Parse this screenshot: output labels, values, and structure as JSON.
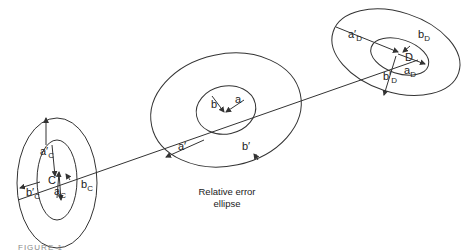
{
  "diagram": {
    "caption_line1": "Relative error",
    "caption_line2": "ellipse",
    "figure_label": "FIGURE 1",
    "stations": {
      "C": {
        "label": "C",
        "a": "a",
        "a_sub": "C",
        "b": "b",
        "b_sub": "C",
        "a_prime": "a′",
        "a_prime_sub": "C",
        "b_prime": "b′",
        "b_prime_sub": "C"
      },
      "D": {
        "label": "D",
        "a": "a",
        "a_sub": "D",
        "b": "b",
        "b_sub": "D",
        "a_prime": "a′",
        "a_prime_sub": "D",
        "b_prime": "b′",
        "b_prime_sub": "D"
      },
      "relative": {
        "a": "a",
        "b": "b",
        "a_prime": "a′",
        "b_prime": "b′"
      }
    }
  }
}
